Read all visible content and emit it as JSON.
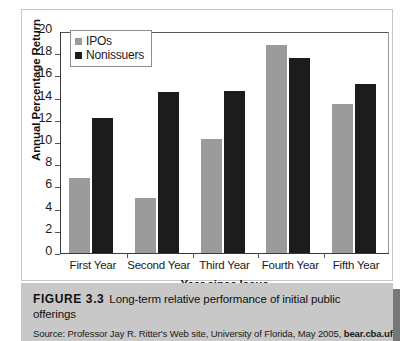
{
  "chart_data": {
    "type": "bar",
    "title": "",
    "xlabel": "Year since Issue",
    "ylabel": "Annual Percentage Return",
    "ylim": [
      0,
      20
    ],
    "ytick_step": 2,
    "yticks": [
      20,
      18,
      16,
      14,
      12,
      10,
      8,
      6,
      4,
      2,
      0
    ],
    "grid": false,
    "legend_position": "top-left",
    "categories": [
      "First Year",
      "Second Year",
      "Third Year",
      "Fourth Year",
      "Fifth Year"
    ],
    "series": [
      {
        "name": "IPOs",
        "color": "#9b9b9b",
        "values": [
          6.8,
          5.0,
          10.3,
          18.7,
          13.4
        ]
      },
      {
        "name": "Nonissuers",
        "color": "#1c1c1c",
        "values": [
          12.2,
          14.5,
          14.6,
          17.6,
          15.2
        ]
      }
    ]
  },
  "caption": {
    "figure_number": "FIGURE 3.3",
    "figure_title": "Long-term relative performance of initial public offerings",
    "source_prefix": "Source: Professor Jay R. Ritter's Web site, University of Florida, May 2005, ",
    "source_link": "bear.cba.ufl."
  }
}
